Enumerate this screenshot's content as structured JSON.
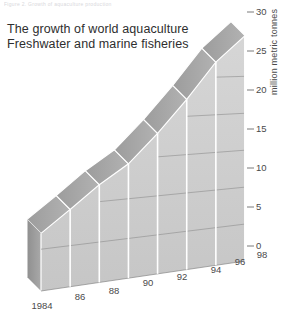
{
  "figure": {
    "cutoff_caption": "Figure 2. Growth of aquaculture production",
    "title_line1": "The growth of world aquaculture",
    "title_line2": "Freshwater and marine fisheries"
  },
  "axes": {
    "y_axis_label": "million metric tonnes",
    "y_ticks": [
      "0",
      "5",
      "10",
      "15",
      "20",
      "25",
      "30"
    ],
    "x_ticks": [
      "1984",
      "86",
      "88",
      "90",
      "92",
      "94",
      "96",
      "98"
    ]
  },
  "colors": {
    "front_face": "#cdcdcd",
    "top_face": "#a6a6a6",
    "end_cap": "#9a9a9a",
    "separator": "#ffffff",
    "gridline": "#8a8a8a",
    "text": "#4a4a4a",
    "title_text": "#2e2e2e",
    "background": "#ffffff"
  },
  "chart_data": {
    "type": "area",
    "title": "The growth of world aquaculture",
    "subtitle": "Freshwater and marine fisheries",
    "xlabel": "",
    "ylabel": "million metric tonnes",
    "ylim": [
      0,
      31
    ],
    "grid": true,
    "legend": "none",
    "style": "3d-extruded-area-ribbon",
    "categories": [
      "1984",
      "1986",
      "1988",
      "1990",
      "1992",
      "1994",
      "1996",
      "1998"
    ],
    "values": [
      6.9,
      9.4,
      12.1,
      14.4,
      18.0,
      22.2,
      27.0,
      30.5
    ],
    "series": [
      {
        "name": "World aquaculture production",
        "values": [
          6.9,
          9.4,
          12.1,
          14.4,
          18.0,
          22.2,
          27.0,
          30.5
        ]
      }
    ],
    "y_ticks": [
      0,
      5,
      10,
      15,
      20,
      25,
      30
    ],
    "annotations": []
  },
  "geometry": {
    "top_front": [
      [
        41,
        231
      ],
      [
        75,
        215
      ],
      [
        109,
        190
      ],
      [
        143,
        166
      ],
      [
        177,
        131
      ],
      [
        211,
        89
      ],
      [
        245,
        40
      ],
      [
        245,
        40
      ]
    ],
    "base_front": [
      [
        41,
        291
      ],
      [
        75,
        286
      ],
      [
        109,
        281
      ],
      [
        143,
        276
      ],
      [
        177,
        271
      ],
      [
        211,
        266
      ],
      [
        245,
        261
      ]
    ],
    "depth_dx": -14,
    "depth_dy": -14
  }
}
